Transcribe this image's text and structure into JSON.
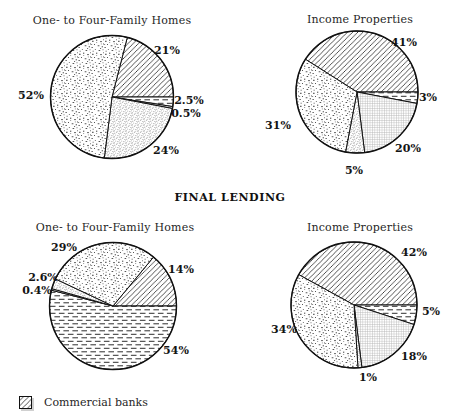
{
  "section_label": "FINAL LENDING",
  "legend": {
    "items": [
      {
        "label": "Commercial banks",
        "pattern": "diagonal-hatch"
      }
    ]
  },
  "colors": {
    "ink": "#111111",
    "hatch_line": "#161616",
    "dash_line": "#2e2e2e",
    "grid_gray": "#b2b2b2",
    "background": "#ffffff"
  },
  "chart_data": [
    {
      "type": "pie",
      "title": "One- to Four-Family Homes",
      "row": "top",
      "start_angle_deg": 14.4,
      "rotation": "clockwise-from-12",
      "slices": [
        {
          "label": "21%",
          "value": 21,
          "pattern": "diagonal-hatch",
          "series": "Commercial banks"
        },
        {
          "label": "2.5%",
          "value": 2.5,
          "pattern": "horizontal-dash"
        },
        {
          "label": "0.5%",
          "value": 0.5,
          "pattern": "fine-grid"
        },
        {
          "label": "24%",
          "value": 24,
          "pattern": "fine-dots"
        },
        {
          "label": "52%",
          "value": 52,
          "pattern": "stipple"
        }
      ]
    },
    {
      "type": "pie",
      "title": "Income Properties",
      "row": "top",
      "start_angle_deg": 302.4,
      "rotation": "clockwise-from-12",
      "slices": [
        {
          "label": "41%",
          "value": 41,
          "pattern": "diagonal-hatch",
          "series": "Commercial banks"
        },
        {
          "label": "3%",
          "value": 3,
          "pattern": "horizontal-dash"
        },
        {
          "label": "20%",
          "value": 20,
          "pattern": "fine-grid"
        },
        {
          "label": "5%",
          "value": 5,
          "pattern": "fine-dots"
        },
        {
          "label": "31%",
          "value": 31,
          "pattern": "stipple"
        }
      ]
    },
    {
      "type": "pie",
      "title": "One- to Four-Family Homes",
      "row": "bottom",
      "start_angle_deg": 39.6,
      "rotation": "clockwise-from-12",
      "slices": [
        {
          "label": "14%",
          "value": 14,
          "pattern": "diagonal-hatch",
          "series": "Commercial banks"
        },
        {
          "label": "54%",
          "value": 54,
          "pattern": "horizontal-dash"
        },
        {
          "label": "0.4%",
          "value": 0.4,
          "pattern": "fine-grid"
        },
        {
          "label": "2.6%",
          "value": 2.6,
          "pattern": "fine-dots"
        },
        {
          "label": "29%",
          "value": 29,
          "pattern": "stipple"
        }
      ]
    },
    {
      "type": "pie",
      "title": "Income Properties",
      "row": "bottom",
      "start_angle_deg": 298.8,
      "rotation": "clockwise-from-12",
      "slices": [
        {
          "label": "42%",
          "value": 42,
          "pattern": "diagonal-hatch",
          "series": "Commercial banks"
        },
        {
          "label": "5%",
          "value": 5,
          "pattern": "horizontal-dash"
        },
        {
          "label": "18%",
          "value": 18,
          "pattern": "fine-grid"
        },
        {
          "label": "1%",
          "value": 1,
          "pattern": "fine-dots"
        },
        {
          "label": "34%",
          "value": 34,
          "pattern": "stipple"
        }
      ]
    }
  ]
}
